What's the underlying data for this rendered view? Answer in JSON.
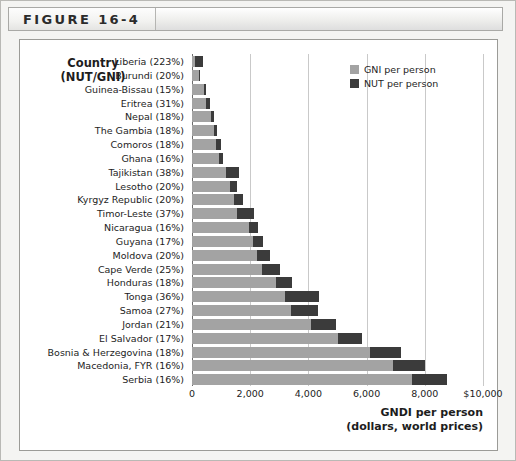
{
  "figure": {
    "label": "FIGURE 16-4"
  },
  "axis_header": {
    "line1": "Country",
    "line2": "(NUT/GNI)"
  },
  "legend": {
    "items": [
      {
        "label": "GNI per person",
        "color": "#a3a3a3",
        "key": "gni"
      },
      {
        "label": "NUT per person",
        "color": "#3b3b3b",
        "key": "nut"
      }
    ]
  },
  "xaxis": {
    "title_line1": "GNDI per person",
    "title_line2": "(dollars, world prices)",
    "ticks": [
      "0",
      "2,000",
      "4,000",
      "6,000",
      "8,000",
      "$10,000"
    ],
    "tick_values": [
      0,
      2000,
      4000,
      6000,
      8000,
      10000
    ]
  },
  "chart_data": {
    "type": "bar",
    "orientation": "horizontal",
    "stacked": true,
    "title": "FIGURE 16-4",
    "xlabel": "GNDI per person (dollars, world prices)",
    "ylabel": "Country (NUT/GNI)",
    "xlim": [
      0,
      10000
    ],
    "xticks": [
      0,
      2000,
      4000,
      6000,
      8000,
      10000
    ],
    "xticklabels": [
      "0",
      "2,000",
      "4,000",
      "6,000",
      "8,000",
      "$10,000"
    ],
    "grid": true,
    "legend_position": "top-right",
    "categories": [
      "Liberia (223%)",
      "Burundi (20%)",
      "Guinea-Bissau (15%)",
      "Eritrea (31%)",
      "Nepal (18%)",
      "The Gambia (18%)",
      "Comoros (18%)",
      "Ghana (16%)",
      "Tajikistan (38%)",
      "Lesotho (20%)",
      "Kyrgyz Republic (20%)",
      "Timor-Leste (37%)",
      "Nicaragua (16%)",
      "Guyana (17%)",
      "Moldova (20%)",
      "Cape Verde (25%)",
      "Honduras (18%)",
      "Tonga (36%)",
      "Samoa (27%)",
      "Jordan (21%)",
      "El Salvador (17%)",
      "Bosnia & Herzegovina (18%)",
      "Macedonia, FYR (16%)",
      "Serbia (16%)"
    ],
    "series": [
      {
        "name": "GNI per person",
        "color": "#a3a3a3",
        "values": [
          120,
          240,
          420,
          480,
          640,
          740,
          840,
          920,
          1180,
          1300,
          1460,
          1560,
          1960,
          2100,
          2220,
          2420,
          2900,
          3200,
          3400,
          4100,
          5000,
          6100,
          6900,
          7550
        ]
      },
      {
        "name": "NUT per person",
        "color": "#3b3b3b",
        "values": [
          268,
          48,
          63,
          149,
          115,
          133,
          151,
          147,
          448,
          260,
          292,
          577,
          314,
          357,
          444,
          605,
          522,
          1152,
          918,
          861,
          850,
          1098,
          1104,
          1208
        ]
      }
    ]
  }
}
